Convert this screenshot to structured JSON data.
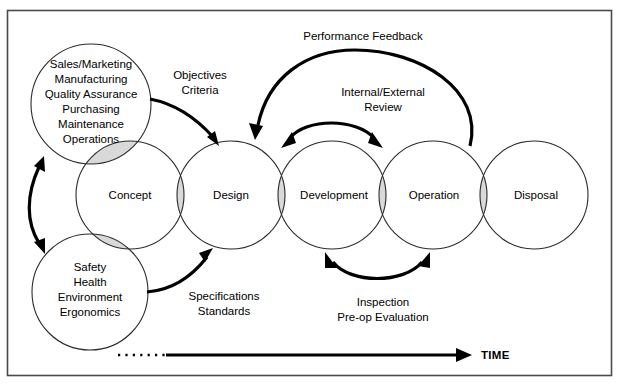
{
  "diagram": {
    "frame": {
      "border_color": "#4a4a4a",
      "background": "#ffffff"
    },
    "colors": {
      "circle_stroke": "#2b2b2b",
      "overlap_fill": "#d9d9d9",
      "arrow": "#000000",
      "text": "#000000"
    },
    "stages": [
      {
        "id": "concept",
        "label": "Concept",
        "cx": 130,
        "cy": 195,
        "r": 54
      },
      {
        "id": "design",
        "label": "Design",
        "cx": 231,
        "cy": 195,
        "r": 54
      },
      {
        "id": "development",
        "label": "Development",
        "cx": 332,
        "cy": 195,
        "r": 54
      },
      {
        "id": "operation",
        "label": "Operation",
        "cx": 433,
        "cy": 195,
        "r": 54
      },
      {
        "id": "disposal",
        "label": "Disposal",
        "cx": 534,
        "cy": 195,
        "r": 54
      }
    ],
    "satellites": [
      {
        "id": "business-functions",
        "cx": 91,
        "cy": 104,
        "r": 60,
        "lines": [
          "Sales/Marketing",
          "Manufacturing",
          "Quality Assurance",
          "Purchasing",
          "Maintenance",
          "Operations"
        ]
      },
      {
        "id": "she-functions",
        "cx": 90,
        "cy": 292,
        "r": 58,
        "lines": [
          "Safety",
          "Health",
          "Environment",
          "Ergonomics"
        ]
      }
    ],
    "annotations": [
      {
        "id": "objectives-criteria",
        "lines": [
          "Objectives",
          "Criteria"
        ],
        "x": 200,
        "y": 77
      },
      {
        "id": "performance-feedback",
        "lines": [
          "Performance Feedback"
        ],
        "x": 363,
        "y": 38
      },
      {
        "id": "internal-external-review",
        "lines": [
          "Internal/External",
          "Review"
        ],
        "x": 383,
        "y": 94
      },
      {
        "id": "specifications-standards",
        "lines": [
          "Specifications",
          "Standards"
        ],
        "x": 224,
        "y": 300
      },
      {
        "id": "inspection-preop",
        "lines": [
          "Inspection",
          "Pre-op Evaluation"
        ],
        "x": 383,
        "y": 306
      }
    ],
    "time_axis": {
      "label": "TIME",
      "dotted_from_x": 118,
      "solid_to_x": 470,
      "y": 355
    },
    "flows": [
      {
        "id": "business-to-design",
        "from": "business-functions",
        "to": "design",
        "direction": "one-way",
        "label": "Objectives / Criteria"
      },
      {
        "id": "she-to-design",
        "from": "she-functions",
        "to": "design",
        "direction": "one-way",
        "label": "Specifications / Standards"
      },
      {
        "id": "operation-to-design",
        "from": "operation",
        "to": "design",
        "direction": "one-way",
        "label": "Performance Feedback"
      },
      {
        "id": "design-development-review",
        "from": "design",
        "to": "development",
        "direction": "two-way",
        "label": "Internal/External Review"
      },
      {
        "id": "development-operation-inspection",
        "from": "development",
        "to": "operation",
        "direction": "two-way",
        "label": "Inspection / Pre-op Evaluation"
      },
      {
        "id": "satellite-link",
        "from": "business-functions",
        "to": "she-functions",
        "direction": "two-way",
        "label": ""
      }
    ]
  }
}
